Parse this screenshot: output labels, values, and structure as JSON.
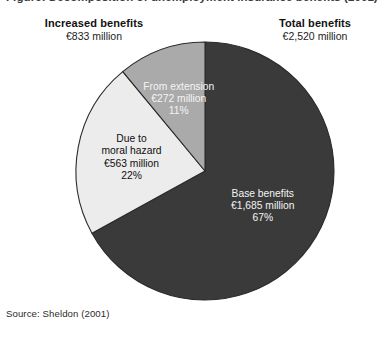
{
  "figure": {
    "title": "Figure: Decomposition of unemployment insurance benefits (2001)",
    "source": "Source: Sheldon (2001)"
  },
  "callouts": {
    "left": {
      "title": "Increased benefits",
      "value": "€833 million"
    },
    "right": {
      "title": "Total benefits",
      "value": "€2,520 million"
    }
  },
  "colors": {
    "base_benefits": "#3a3a3a",
    "moral_hazard": "#ececec",
    "from_extension": "#aaaaaa",
    "outline": "#2a2a2a",
    "background": "#ffffff"
  },
  "chart_data": {
    "type": "pie",
    "start_angle_deg": 0,
    "direction": "clockwise",
    "unit": "€ million",
    "total_label": "Total benefits",
    "total_value": 2520,
    "total_value_text": "€2,520 million",
    "slices": [
      {
        "name": "Base benefits",
        "label_line1": "Base benefits",
        "label_line2": "€1,685 million",
        "label_line3": "67%",
        "value": 1685,
        "percent": 67,
        "color": "#3a3a3a",
        "text_color": "light"
      },
      {
        "name": "Due to moral hazard",
        "label_line1": "Due to",
        "label_line2": "moral hazard",
        "label_line3": "€563 million",
        "label_line4": "22%",
        "value": 563,
        "percent": 22,
        "color": "#ececec",
        "text_color": "dark"
      },
      {
        "name": "From extension",
        "label_line1": "From extension",
        "label_line2": "€272 million",
        "label_line3": "11%",
        "value": 272,
        "percent": 11,
        "color": "#aaaaaa",
        "text_color": "light"
      }
    ],
    "legend": "none",
    "grid": false
  }
}
